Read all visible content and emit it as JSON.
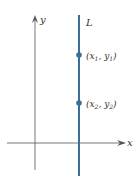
{
  "diagram": {
    "axes": {
      "x_label": "x",
      "y_label": "y",
      "color": "#555555"
    },
    "line": {
      "label": "L",
      "color": "#3a6f98",
      "orientation": "vertical"
    },
    "points": [
      {
        "label_open": "(x",
        "sub1": "1",
        "mid": ", y",
        "sub2": "1",
        "label_close": ")"
      },
      {
        "label_open": "(x",
        "sub1": "2",
        "mid": ", y",
        "sub2": "2",
        "label_close": ")"
      }
    ],
    "point_color": "#3a6f98"
  }
}
